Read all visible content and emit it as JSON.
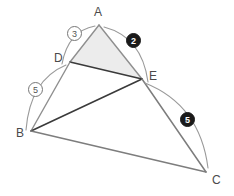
{
  "figure": {
    "type": "geometry-diagram",
    "width": 234,
    "height": 196,
    "background": "#ffffff"
  },
  "colors": {
    "dark_segment": "#3a3a3a",
    "light_segment": "#8f8f8f",
    "mid_segment": "#7d7d7d",
    "arc": "#9a9a9a",
    "fill_triangle": "#ececec",
    "label_text": "#4a4a4a",
    "badge_dark_bg": "#1a1a1a",
    "badge_light_bg": "#ffffff",
    "badge_light_border": "#777777"
  },
  "points": [
    {
      "id": "A",
      "label": "A",
      "x": 99,
      "y": 25,
      "label_x": 94,
      "label_y": 6
    },
    {
      "id": "D",
      "label": "D",
      "x": 70,
      "y": 62,
      "label_x": 54,
      "label_y": 52
    },
    {
      "id": "E",
      "label": "E",
      "x": 142,
      "y": 79,
      "label_x": 149,
      "label_y": 70
    },
    {
      "id": "B",
      "label": "B",
      "x": 31,
      "y": 131,
      "label_x": 16,
      "label_y": 127
    },
    {
      "id": "C",
      "label": "C",
      "x": 206,
      "y": 172,
      "label_x": 212,
      "label_y": 174
    }
  ],
  "segments": [
    {
      "id": "A-D",
      "from": "A",
      "to": "D",
      "weight": "light"
    },
    {
      "id": "A-E",
      "from": "A",
      "to": "E",
      "weight": "light"
    },
    {
      "id": "D-E",
      "from": "D",
      "to": "E",
      "weight": "dark"
    },
    {
      "id": "B-D",
      "from": "B",
      "to": "D",
      "weight": "light"
    },
    {
      "id": "B-E",
      "from": "B",
      "to": "E",
      "weight": "dark"
    },
    {
      "id": "B-C",
      "from": "B",
      "to": "C",
      "weight": "mid"
    },
    {
      "id": "E-C",
      "from": "E",
      "to": "C",
      "weight": "mid"
    }
  ],
  "shaded_region": {
    "id": "triangle-ADE",
    "vertices": [
      "A",
      "D",
      "E"
    ]
  },
  "measure_arcs": [
    {
      "id": "arc-AD",
      "value": "3",
      "style": "light",
      "from": "A",
      "to": "D",
      "path": "M 95 26 Q 68 31 62 64",
      "badge_x": 67,
      "badge_y": 26
    },
    {
      "id": "arc-AE",
      "value": "2",
      "style": "dark",
      "from": "A",
      "to": "E",
      "path": "M 104 27 Q 142 37 148 82",
      "badge_x": 126,
      "badge_y": 33
    },
    {
      "id": "arc-BD",
      "value": "5",
      "style": "light",
      "from": "D",
      "to": "B",
      "path": "M 66 65 Q 30 80 26 130",
      "badge_x": 28,
      "badge_y": 82
    },
    {
      "id": "arc-EC",
      "value": "5",
      "style": "dark",
      "from": "E",
      "to": "C",
      "path": "M 145 83 Q 200 105 208 168",
      "badge_x": 180,
      "badge_y": 112
    }
  ]
}
